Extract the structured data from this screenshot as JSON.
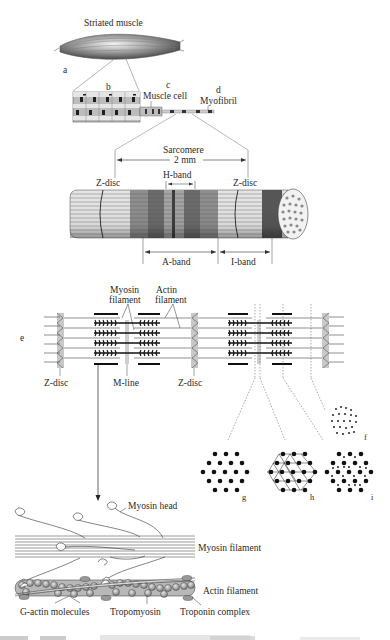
{
  "diagram": {
    "type": "biological-hierarchy-diagram",
    "panels": {
      "a": {
        "letter": "a",
        "title": "Striated muscle"
      },
      "b": {
        "letter": "b"
      },
      "c": {
        "letter": "c",
        "label": "Muscle cell"
      },
      "d": {
        "letter": "d",
        "label": "Myofibril"
      },
      "sarcomere": {
        "title": "Sarcomere",
        "length": "2 mm",
        "z_disc_left": "Z-disc",
        "z_disc_right": "Z-disc",
        "h_band": "H-band",
        "a_band": "A-band",
        "i_band": "I-band"
      },
      "e": {
        "letter": "e",
        "myosin_label": "Myosin\nfilament",
        "myosin_line1": "Myosin",
        "myosin_line2": "filament",
        "actin_line1": "Actin",
        "actin_line2": "filament",
        "z_disc_left": "Z-disc",
        "m_line": "M-line",
        "z_disc_right": "Z-disc"
      },
      "cross_sections": [
        {
          "letter": "f",
          "description": "actin only (I-band)"
        },
        {
          "letter": "g",
          "description": "myosin only (H-band)"
        },
        {
          "letter": "h",
          "description": "myosin with M-line bridges"
        },
        {
          "letter": "i",
          "description": "actin + myosin overlap"
        }
      ],
      "molecular": {
        "myosin_head": "Myosin head",
        "myosin_filament": "Myosin filament",
        "actin_filament": "Actin filament",
        "g_actin": "G-actin molecules",
        "tropomyosin": "Tropomyosin",
        "troponin": "Troponin complex"
      }
    },
    "caption": {
      "visible": "partially cut off at bottom edge; text illegible"
    },
    "colors": {
      "line": "#333333",
      "dark_band": "#555555",
      "light_band": "#cfcfcf",
      "z_disc_fill": "#c8c8c8",
      "actin_bead": "#9a9a9a"
    }
  }
}
